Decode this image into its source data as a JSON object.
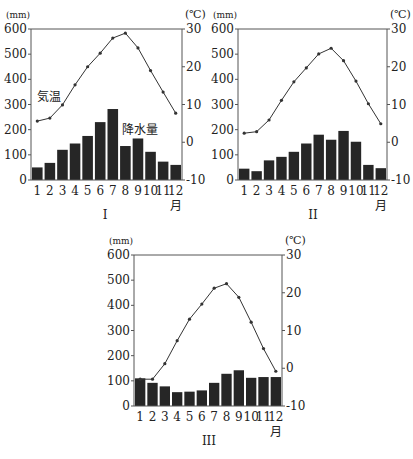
{
  "chart_data": [
    {
      "id": "I",
      "type": "bar+line",
      "title": "I",
      "xlabel": "月",
      "categories": [
        "1",
        "2",
        "3",
        "4",
        "5",
        "6",
        "7",
        "8",
        "9",
        "10",
        "11",
        "12"
      ],
      "left_axis": {
        "label": "(mm)",
        "ticks": [
          0,
          100,
          200,
          300,
          400,
          500,
          600
        ],
        "range": [
          0,
          600
        ]
      },
      "right_axis": {
        "label": "(℃)",
        "ticks": [
          -10,
          0,
          10,
          20,
          30
        ],
        "range": [
          -10,
          30
        ]
      },
      "series": [
        {
          "name": "降水量",
          "type": "bar",
          "axis": "left",
          "values": [
            50,
            68,
            120,
            145,
            175,
            230,
            282,
            135,
            165,
            112,
            73,
            60
          ]
        },
        {
          "name": "気温",
          "type": "line",
          "axis": "right",
          "values": [
            5.6,
            6.4,
            9.9,
            15.2,
            20.0,
            23.6,
            27.6,
            28.9,
            25.0,
            19.0,
            13.3,
            7.7
          ]
        }
      ],
      "annotations": [
        {
          "text": "気温",
          "near": "line"
        },
        {
          "text": "降水量",
          "near": "bars"
        }
      ],
      "grid": false
    },
    {
      "id": "II",
      "type": "bar+line",
      "title": "II",
      "xlabel": "月",
      "categories": [
        "1",
        "2",
        "3",
        "4",
        "5",
        "6",
        "7",
        "8",
        "9",
        "10",
        "11",
        "12"
      ],
      "left_axis": {
        "label": "(mm)",
        "ticks": [
          0,
          100,
          200,
          300,
          400,
          500,
          600
        ],
        "range": [
          0,
          600
        ]
      },
      "right_axis": {
        "label": "(℃)",
        "ticks": [
          -10,
          0,
          10,
          20,
          30
        ],
        "range": [
          -10,
          30
        ]
      },
      "series": [
        {
          "name": "降水量",
          "type": "bar",
          "axis": "left",
          "values": [
            45,
            35,
            78,
            92,
            112,
            145,
            180,
            160,
            195,
            152,
            60,
            47
          ]
        },
        {
          "name": "気温",
          "type": "line",
          "axis": "right",
          "values": [
            2.4,
            2.8,
            5.9,
            11.1,
            16.0,
            19.7,
            23.4,
            24.9,
            21.6,
            16.2,
            10.2,
            4.9
          ]
        }
      ],
      "grid": false
    },
    {
      "id": "III",
      "type": "bar+line",
      "title": "III",
      "xlabel": "月",
      "categories": [
        "1",
        "2",
        "3",
        "4",
        "5",
        "6",
        "7",
        "8",
        "9",
        "10",
        "11",
        "12"
      ],
      "left_axis": {
        "label": "(mm)",
        "ticks": [
          0,
          100,
          200,
          300,
          400,
          500,
          600
        ],
        "range": [
          0,
          600
        ]
      },
      "right_axis": {
        "label": "(℃)",
        "ticks": [
          -10,
          0,
          10,
          20,
          30
        ],
        "range": [
          -10,
          30
        ]
      },
      "series": [
        {
          "name": "降水量",
          "type": "bar",
          "axis": "left",
          "values": [
            110,
            92,
            78,
            55,
            57,
            62,
            92,
            128,
            142,
            112,
            115,
            115
          ]
        },
        {
          "name": "気温",
          "type": "line",
          "axis": "right",
          "values": [
            -2.9,
            -2.9,
            1.2,
            7.3,
            13.0,
            17.0,
            21.2,
            22.4,
            18.8,
            12.2,
            5.2,
            -0.8
          ]
        }
      ],
      "grid": false
    }
  ],
  "labels": {
    "chart1_caption": "I",
    "chart2_caption": "II",
    "chart3_caption": "III",
    "temp_label": "気温",
    "precip_label": "降水量",
    "month_unit": "月",
    "mm_unit": "(mm)",
    "c_unit": "(℃)"
  },
  "colors": {
    "bar": "#262626",
    "line": "#333333",
    "axis": "#555555"
  }
}
